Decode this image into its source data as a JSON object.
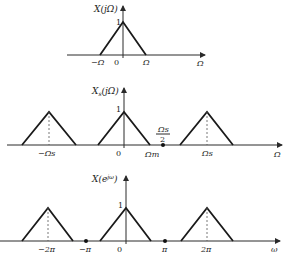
{
  "plots": [
    {
      "id": "continuous-spectrum",
      "title": "X(jΩ)",
      "x_axis_label": "Ω",
      "peak_label": "1",
      "origin_label": "0",
      "tick_labels": [
        "−Ω",
        "Ω"
      ],
      "triangles": [
        {
          "center": 0,
          "halfwidth": 1,
          "height": 1
        }
      ]
    },
    {
      "id": "sampled-spectrum",
      "title": "Xs(jΩ)",
      "title_main": "X",
      "title_sub": "s",
      "title_arg": "(jΩ)",
      "x_axis_label": "Ω",
      "peak_label": "1",
      "origin_label": "0",
      "tick_labels": [
        "−Ωs",
        "Ωm",
        "Ωs"
      ],
      "fraction_label": {
        "numerator": "Ωs",
        "denominator": "2"
      },
      "triangles": [
        {
          "center": -1,
          "halfwidth": 0.32,
          "height": 1
        },
        {
          "center": 0,
          "halfwidth": 0.32,
          "height": 1
        },
        {
          "center": 1,
          "halfwidth": 0.32,
          "height": 1
        }
      ],
      "dots": [
        0.5
      ]
    },
    {
      "id": "dtft-spectrum",
      "title": "X(e^jω)",
      "title_main": "X(e",
      "title_sup": "jω",
      "title_end": ")",
      "x_axis_label": "ω",
      "peak_label": "1",
      "origin_label": "0",
      "tick_labels": [
        "−2π",
        "−π",
        "π",
        "2π"
      ],
      "triangles": [
        {
          "center": -2,
          "halfwidth": 0.64,
          "height": 1
        },
        {
          "center": 0,
          "halfwidth": 0.64,
          "height": 1
        },
        {
          "center": 2,
          "halfwidth": 0.64,
          "height": 1
        }
      ],
      "dots": [
        -1,
        1
      ]
    }
  ]
}
